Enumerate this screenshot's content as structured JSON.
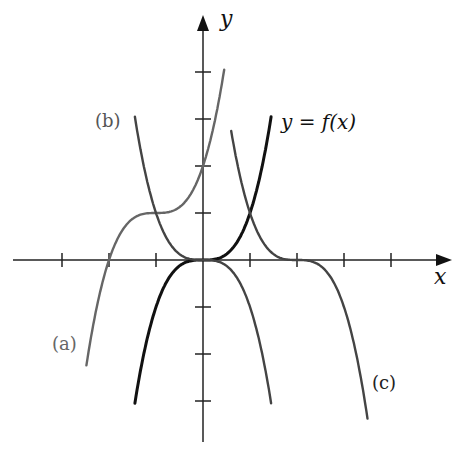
{
  "chart_data": {
    "type": "line",
    "title": "",
    "xlabel": "x",
    "ylabel": "y",
    "grid": false,
    "xlim": [
      -4,
      5
    ],
    "ylim": [
      -4,
      5
    ],
    "x_ticks": [
      -3,
      -2,
      -1,
      1,
      2,
      3,
      4
    ],
    "y_ticks": [
      -3,
      -2,
      -1,
      1,
      2,
      3,
      4
    ],
    "series": [
      {
        "name": "y = f(x)",
        "expression": "x^3",
        "color": "#111111",
        "domain": [
          -1.45,
          1.45
        ]
      },
      {
        "name": "(a)",
        "expression": "(x+1)^3 + 1",
        "color": "#666666",
        "domain": [
          -2.48,
          0.45
        ]
      },
      {
        "name": "(b)",
        "expression": "-x^3",
        "color": "#444444",
        "domain": [
          -1.45,
          1.45
        ]
      },
      {
        "name": "(c)",
        "expression": "-(x-2)^3",
        "color": "#444444",
        "domain": [
          0.6,
          3.5
        ]
      }
    ]
  },
  "labels": {
    "x_axis": "x",
    "y_axis": "y",
    "f": "y = f(x)",
    "a": "(a)",
    "b": "(b)",
    "c": "(c)"
  },
  "geometry": {
    "origin_px": [
      203,
      260
    ],
    "unit_px": 47
  }
}
